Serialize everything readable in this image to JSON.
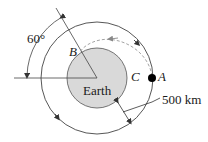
{
  "diagram": {
    "labels": {
      "angle": "60°",
      "point_b": "B",
      "point_c": "C",
      "point_a": "A",
      "earth": "Earth",
      "altitude": "500 km"
    },
    "colors": {
      "earth_fill": "#d9d9d9",
      "line": "#333333",
      "dashed": "#999999",
      "satellite": "#000000"
    }
  }
}
